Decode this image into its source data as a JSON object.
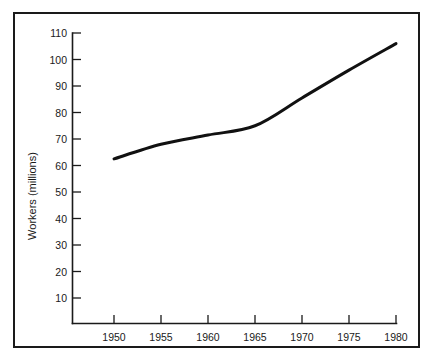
{
  "chart_data": {
    "type": "line",
    "title": "",
    "xlabel": "",
    "ylabel": "Workers (millions)",
    "x": [
      1950,
      1955,
      1960,
      1965,
      1970,
      1975,
      1980
    ],
    "values": [
      62.5,
      68,
      71.5,
      75,
      85.5,
      96,
      106
    ],
    "series": [
      {
        "name": "Workers",
        "values": [
          62.5,
          68,
          71.5,
          75,
          85.5,
          96,
          106
        ]
      }
    ],
    "xlim": [
      1950,
      1980
    ],
    "ylim": [
      0,
      110
    ],
    "xticks": [
      1950,
      1955,
      1960,
      1965,
      1970,
      1975,
      1980
    ],
    "xtick_labels": [
      "1950",
      "1955",
      "1960",
      "1965",
      "1970",
      "1975",
      "1980"
    ],
    "yticks": [
      10,
      20,
      30,
      40,
      50,
      60,
      70,
      80,
      90,
      100,
      110
    ],
    "ytick_labels": [
      "10",
      "20",
      "30",
      "40",
      "50",
      "60",
      "70",
      "80",
      "90",
      "100",
      "110"
    ],
    "grid": false,
    "legend": false,
    "legend_position": "none",
    "line_color": "#111111",
    "frame_color": "#1a1a1a",
    "background_color": "#ffffff",
    "annotations": []
  },
  "axes": {
    "y_axis_title": "Workers (millions)",
    "y_tick_labels": [
      "110",
      "100",
      "90",
      "80",
      "70",
      "60",
      "50",
      "40",
      "30",
      "20",
      "10"
    ],
    "x_tick_labels": [
      "1950",
      "1955",
      "1960",
      "1965",
      "1970",
      "1975",
      "1980"
    ]
  }
}
